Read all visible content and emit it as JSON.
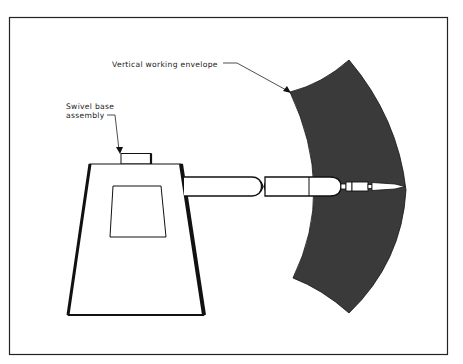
{
  "figure": {
    "type": "robot work envelope diagram",
    "labels": {
      "envelope": "Vertical working envelope",
      "swivel_line1": "Swivel base",
      "swivel_line2": "assembly"
    },
    "colors": {
      "background": "#ffffff",
      "line": "#111111",
      "envelope_fill": "#3a3a3a"
    }
  }
}
